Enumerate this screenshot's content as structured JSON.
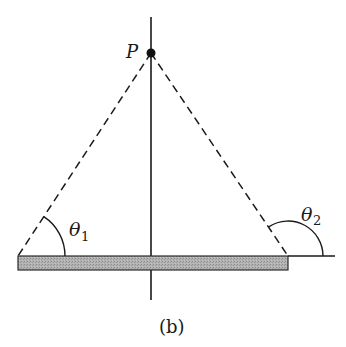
{
  "figure": {
    "caption": "(b)",
    "point_label": "P",
    "angle1": {
      "symbol": "θ",
      "subscript": "1"
    },
    "angle2": {
      "symbol": "θ",
      "subscript": "2"
    }
  },
  "geometry": {
    "point_P": [
      151,
      53
    ],
    "bar": {
      "x1": 18,
      "x2": 288,
      "y_top": 256,
      "y_bottom": 270
    },
    "axis": {
      "x": 151,
      "y_top": 17,
      "y_bottom": 300
    },
    "extension_line": {
      "x1": 288,
      "x2": 335,
      "y": 256
    }
  },
  "colors": {
    "stroke": "#1a1a1a",
    "bar_fill": "#a9a9a9"
  }
}
